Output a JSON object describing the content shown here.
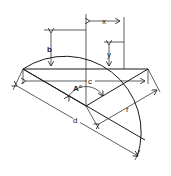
{
  "diagram": {
    "labels": {
      "x": "x",
      "y": "y",
      "b": "b",
      "c": "c",
      "A": "A°",
      "r": "r",
      "d": "d"
    },
    "colors": {
      "line": "#1a1a1a",
      "background": "#ffffff"
    }
  }
}
